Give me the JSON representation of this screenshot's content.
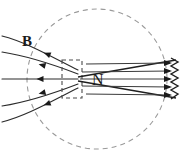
{
  "figure": {
    "type": "physics-field-diagram",
    "width": 195,
    "height": 158,
    "background_color": "#ffffff"
  },
  "labels": {
    "field_label": "B",
    "pole_label": "N"
  },
  "label_positions": {
    "field_label_x": 22,
    "field_label_y": 46,
    "pole_label_x": 92,
    "pole_label_y": 85
  },
  "colors": {
    "field_line": "#2b2b2b",
    "magnet_outline": "#1f1f1f",
    "boundary_circle": "#9a9a9a",
    "dashed_box": "#4a4a4a",
    "arrow_fill": "#1a1a1a",
    "label": "#1a1a1a"
  },
  "boundary": {
    "shape": "dashed-circle",
    "center_x": 97,
    "center_y": 79,
    "radius": 70,
    "dash_pattern": "5 4",
    "stroke_width": 1.1
  },
  "dashed_box": {
    "x": 62,
    "y": 60,
    "width": 20,
    "height": 38,
    "dash_pattern": "4 3"
  },
  "magnet": {
    "description": "bar magnet north pole, tapered wedge opening to the right",
    "tip_x": 78,
    "tip_y": 79,
    "right_x": 176,
    "top_right_y": 60,
    "bottom_right_y": 98
  },
  "field_lines_left": {
    "count": 5,
    "direction": "into-pole-leftward-arrows",
    "arrow_direction": "left",
    "paths": [
      {
        "name": "upper-outer",
        "d": "M 2 36 C 26 42 50 56 78 70"
      },
      {
        "name": "upper-inner",
        "d": "M 2 52 C 28 56 52 64 78 74"
      },
      {
        "name": "center",
        "d": "M 2 79 L 78 79"
      },
      {
        "name": "lower-inner",
        "d": "M 2 106 C 28 102 52 94 78 84"
      },
      {
        "name": "lower-outer",
        "d": "M 2 122 C 26 116 50 102 78 88"
      }
    ],
    "arrow_points": [
      {
        "x": 47,
        "y": 54,
        "angle": 22
      },
      {
        "x": 42,
        "y": 65,
        "angle": 14
      },
      {
        "x": 40,
        "y": 79,
        "angle": 0
      },
      {
        "x": 42,
        "y": 93,
        "angle": -14
      },
      {
        "x": 47,
        "y": 104,
        "angle": -22
      }
    ]
  },
  "field_lines_right": {
    "count": 5,
    "direction": "out-of-magnet-rightward-arrows",
    "arrow_direction": "right",
    "lines": [
      {
        "name": "line-1",
        "x1": 80,
        "y1": 64,
        "x2": 172,
        "y2": 63
      },
      {
        "name": "line-2",
        "x1": 80,
        "y1": 72,
        "x2": 172,
        "y2": 71
      },
      {
        "name": "line-3",
        "x1": 80,
        "y1": 79,
        "x2": 172,
        "y2": 79
      },
      {
        "name": "line-4",
        "x1": 80,
        "y1": 86,
        "x2": 172,
        "y2": 87
      },
      {
        "name": "line-5",
        "x1": 80,
        "y1": 94,
        "x2": 172,
        "y2": 95
      }
    ],
    "arrow_points": [
      {
        "x": 172,
        "y": 63
      },
      {
        "x": 172,
        "y": 71
      },
      {
        "x": 172,
        "y": 79
      },
      {
        "x": 172,
        "y": 87
      },
      {
        "x": 172,
        "y": 95
      }
    ]
  },
  "right_edge": {
    "description": "jagged zig-zag right termination of magnet body",
    "d": "M 170 58 L 178 62 L 170 66 L 178 70 L 170 74 L 178 78 L 170 82 L 178 86 L 170 90 L 178 94 L 170 99"
  }
}
